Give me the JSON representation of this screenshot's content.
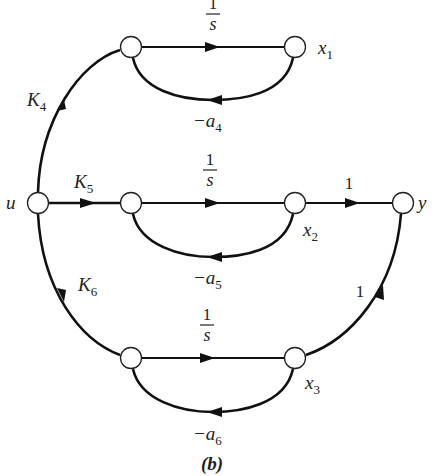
{
  "diagram": {
    "type": "signal-flow-graph",
    "caption": "(b)",
    "nodes": [
      {
        "id": "u",
        "label": "u",
        "x": 38,
        "y": 203
      },
      {
        "id": "n1in",
        "label": "",
        "x": 131,
        "y": 47
      },
      {
        "id": "x1",
        "label": "x",
        "sub": "1",
        "x": 295,
        "y": 47
      },
      {
        "id": "n2in",
        "label": "",
        "x": 131,
        "y": 203
      },
      {
        "id": "x2",
        "label": "x",
        "sub": "2",
        "x": 295,
        "y": 203
      },
      {
        "id": "y",
        "label": "y",
        "x": 403,
        "y": 203
      },
      {
        "id": "n3in",
        "label": "",
        "x": 131,
        "y": 358
      },
      {
        "id": "x3",
        "label": "x",
        "sub": "3",
        "x": 295,
        "y": 358
      }
    ],
    "edges": [
      {
        "from": "u",
        "to": "n1in",
        "gain": "K",
        "sub": "4"
      },
      {
        "from": "u",
        "to": "n2in",
        "gain": "K",
        "sub": "5"
      },
      {
        "from": "u",
        "to": "n3in",
        "gain": "K",
        "sub": "6"
      },
      {
        "from": "n1in",
        "to": "x1",
        "gain_num": "1",
        "gain_den": "s"
      },
      {
        "from": "n2in",
        "to": "x2",
        "gain_num": "1",
        "gain_den": "s"
      },
      {
        "from": "n3in",
        "to": "x3",
        "gain_num": "1",
        "gain_den": "s"
      },
      {
        "from": "x1",
        "to": "n1in",
        "gain": "−a",
        "sub": "4"
      },
      {
        "from": "x2",
        "to": "n2in",
        "gain": "−a",
        "sub": "5"
      },
      {
        "from": "x3",
        "to": "n3in",
        "gain": "−a",
        "sub": "6"
      },
      {
        "from": "x2",
        "to": "y",
        "gain": "1"
      },
      {
        "from": "x3",
        "to": "y",
        "gain": "1"
      }
    ]
  },
  "labels": {
    "u": "u",
    "y": "y",
    "x": "x",
    "x1_sub": "1",
    "x2_sub": "2",
    "x3_sub": "3",
    "K": "K",
    "K4_sub": "4",
    "K5_sub": "5",
    "K6_sub": "6",
    "one": "1",
    "s": "s",
    "minus_a": "−a",
    "a4_sub": "4",
    "a5_sub": "5",
    "a6_sub": "6",
    "gain_x2_y": "1",
    "gain_x3_y": "1",
    "caption": "(b)"
  }
}
